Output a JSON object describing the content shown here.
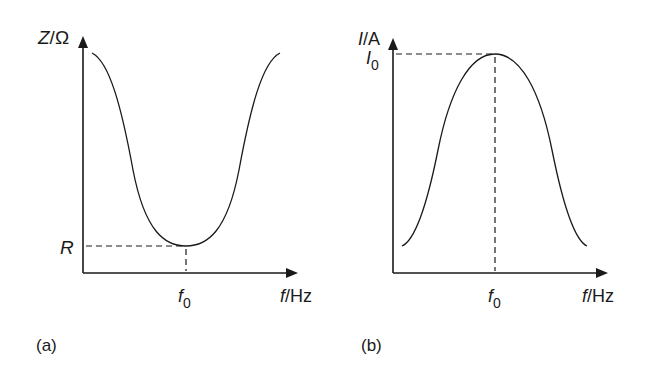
{
  "figure": {
    "panels": [
      {
        "id": "a",
        "caption": "(a)",
        "y_axis_label": {
          "main": "Z",
          "sep": "/",
          "unit": "Ω"
        },
        "x_axis_label": {
          "main": "f",
          "sep": "/",
          "unit": "Hz"
        },
        "y_marker": "R",
        "x_marker": {
          "main": "f",
          "sub": "0"
        },
        "curve": "impedance vs frequency — minimum R at resonant frequency f0"
      },
      {
        "id": "b",
        "caption": "(b)",
        "y_axis_label": {
          "main": "I",
          "sep": "/",
          "unit": "A"
        },
        "x_axis_label": {
          "main": "f",
          "sep": "/",
          "unit": "Hz"
        },
        "y_marker": {
          "main": "I",
          "sub": "0"
        },
        "x_marker": {
          "main": "f",
          "sub": "0"
        },
        "curve": "current vs frequency — maximum I0 at resonant frequency f0"
      }
    ],
    "colors": {
      "ink": "#1a1a1a",
      "background": "#ffffff"
    }
  }
}
